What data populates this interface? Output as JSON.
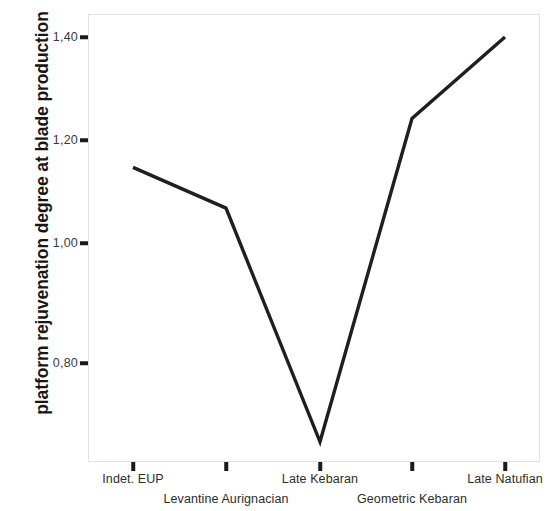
{
  "chart_data": {
    "type": "line",
    "title": "",
    "subtitle": "",
    "xlabel": "",
    "ylabel": "platform rejuvenation degree at blade production",
    "categories": [
      "Indet. EUP",
      "Levantine Aurignacian",
      "Late Kebaran",
      "Geometric Kebaran",
      "Late Natufian"
    ],
    "values": [
      1.16,
      1.085,
      0.655,
      1.25,
      1.4
    ],
    "series": [
      {
        "name": "platform rejuvenation degree at blade production",
        "values": [
          1.16,
          1.085,
          0.655,
          1.25,
          1.4
        ]
      }
    ],
    "y_tick_labels": [
      "1,40",
      "1,20",
      "1,00",
      "0,80"
    ],
    "y_tick_values": [
      1.4,
      1.2,
      1.0,
      0.8
    ],
    "ylim": [
      0.6,
      1.435
    ],
    "xlim": [
      0,
      6
    ],
    "grid": false,
    "legend": null,
    "legend_position": "none",
    "line_color": "#1f1f1f",
    "frame_color": "#e2e2e2",
    "background_color": "#ffffff"
  },
  "axes": {
    "y_title": "platform rejuvenation degree at blade production",
    "y_ticks": [
      {
        "label": "1,40",
        "value": 1.4
      },
      {
        "label": "1,20",
        "value": 1.2
      },
      {
        "label": "1,00",
        "value": 1.0
      },
      {
        "label": "0,80",
        "value": 0.8
      }
    ],
    "x_ticks": [
      {
        "label": "Indet. EUP",
        "row": "upper"
      },
      {
        "label": "Levantine Aurignacian",
        "row": "lower"
      },
      {
        "label": "Late Kebaran",
        "row": "upper"
      },
      {
        "label": "Geometric Kebaran",
        "row": "lower"
      },
      {
        "label": "Late Natufian",
        "row": "upper"
      }
    ]
  }
}
